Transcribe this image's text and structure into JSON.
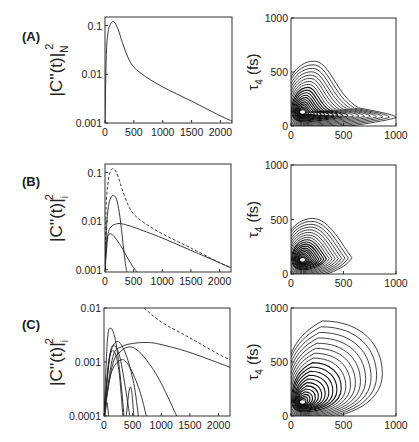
{
  "figure": {
    "panels": [
      {
        "label": "(A)",
        "left_ylabel_main": "|C''(t)|",
        "left_ylabel_sub": "N",
        "left_ylabel_sup": "2"
      },
      {
        "label": "(B)",
        "left_ylabel_main": "|C''(t)|",
        "left_ylabel_sub": "i",
        "left_ylabel_sup": "2"
      },
      {
        "label": "(C)",
        "left_ylabel_main": "|C''(t)|",
        "left_ylabel_sub": "i",
        "left_ylabel_sup": "2"
      }
    ],
    "right_ylabel": "τ",
    "right_ylabel_sub": "4",
    "right_ylabel_unit": "(fs)"
  },
  "chart_data": [
    {
      "id": "A-left",
      "type": "line",
      "yscale": "log",
      "xlabel": "",
      "ylabel": "|C''_N(t)|^2",
      "xlim": [
        0,
        2200
      ],
      "ylim": [
        0.001,
        0.15
      ],
      "xticks": [
        "0",
        "500",
        "1000",
        "1500",
        "2000"
      ],
      "yticks": [
        "0.001",
        "0.01",
        "0.1"
      ],
      "series": [
        {
          "name": "total",
          "style": "solid",
          "x": [
            0,
            20,
            50,
            100,
            150,
            200,
            250,
            300,
            400,
            500,
            700,
            1000,
            1500,
            2000,
            2200
          ],
          "y": [
            0.001,
            0.02,
            0.07,
            0.11,
            0.12,
            0.1,
            0.07,
            0.045,
            0.022,
            0.014,
            0.009,
            0.0055,
            0.0028,
            0.0014,
            0.0011
          ]
        }
      ]
    },
    {
      "id": "A-right",
      "type": "contour",
      "xlabel": "",
      "ylabel": "τ4 (fs)",
      "xlim": [
        0,
        1000
      ],
      "ylim": [
        0,
        1000
      ],
      "xticks": [
        "0",
        "500",
        "1000"
      ],
      "yticks": [
        "0",
        "500",
        "1000"
      ],
      "peak": [
        110,
        130
      ],
      "outer_contour_extent": {
        "x_max": 1000,
        "y_max": 600
      }
    },
    {
      "id": "B-left",
      "type": "line",
      "yscale": "log",
      "xlabel": "",
      "ylabel": "|C''_i(t)|^2",
      "xlim": [
        0,
        2200
      ],
      "ylim": [
        0.0009,
        0.15
      ],
      "xticks": [
        "0",
        "500",
        "1000",
        "1500",
        "2000"
      ],
      "yticks": [
        "0.001",
        "0.01",
        "0.1"
      ],
      "series": [
        {
          "name": "total",
          "style": "dashed",
          "x": [
            0,
            20,
            60,
            100,
            150,
            200,
            250,
            300,
            400,
            500,
            700,
            1000,
            1500,
            2000,
            2200
          ],
          "y": [
            0.001,
            0.02,
            0.07,
            0.11,
            0.12,
            0.1,
            0.07,
            0.045,
            0.022,
            0.014,
            0.009,
            0.0055,
            0.0028,
            0.0014,
            0.0011
          ]
        },
        {
          "name": "i=1",
          "style": "solid",
          "x": [
            0,
            30,
            60,
            100,
            150,
            200,
            250,
            300,
            350,
            380
          ],
          "y": [
            0.001,
            0.008,
            0.02,
            0.03,
            0.034,
            0.028,
            0.015,
            0.005,
            0.0015,
            0.0009
          ]
        },
        {
          "name": "i=2",
          "style": "solid",
          "x": [
            0,
            50,
            100,
            200,
            300,
            500,
            1000,
            1500,
            2000,
            2200
          ],
          "y": [
            0.001,
            0.005,
            0.0075,
            0.0088,
            0.0088,
            0.0075,
            0.0045,
            0.0025,
            0.0014,
            0.0011
          ]
        },
        {
          "name": "i=3",
          "style": "solid",
          "x": [
            0,
            30,
            60,
            100,
            150,
            200,
            300,
            400,
            500,
            560
          ],
          "y": [
            0.001,
            0.004,
            0.0052,
            0.0055,
            0.005,
            0.0042,
            0.0028,
            0.0017,
            0.0011,
            0.0009
          ]
        }
      ]
    },
    {
      "id": "B-right",
      "type": "contour",
      "xlabel": "",
      "ylabel": "τ4 (fs)",
      "xlim": [
        0,
        1000
      ],
      "ylim": [
        0,
        1000
      ],
      "xticks": [
        "0",
        "500",
        "1000"
      ],
      "yticks": [
        "0",
        "500",
        "1000"
      ],
      "peak": [
        110,
        130
      ],
      "outer_contour_extent": {
        "x_max": 580,
        "y_max": 510
      }
    },
    {
      "id": "C-left",
      "type": "line",
      "yscale": "log",
      "xlabel": "",
      "ylabel": "|C''_i(t)|^2",
      "xlim": [
        0,
        2200
      ],
      "ylim": [
        0.0001,
        0.01
      ],
      "xticks": [
        "0",
        "500",
        "1000",
        "1500",
        "2000"
      ],
      "yticks": [
        "0.0001",
        "0.001",
        "0.01"
      ],
      "series": [
        {
          "name": "total",
          "style": "dashed",
          "x": [
            700,
            1000,
            1500,
            2000,
            2200
          ],
          "y": [
            0.01,
            0.0055,
            0.0028,
            0.0014,
            0.0011
          ]
        },
        {
          "name": "mode-a",
          "style": "solid",
          "x": [
            0,
            150,
            300,
            500,
            750,
            1000,
            1500,
            2200
          ],
          "y": [
            0.0001,
            0.0012,
            0.0019,
            0.0022,
            0.0023,
            0.0021,
            0.0015,
            0.0008
          ]
        },
        {
          "name": "mode-b",
          "style": "solid",
          "x": [
            0,
            150,
            300,
            450,
            600,
            800,
            1000,
            1270
          ],
          "y": [
            0.0001,
            0.0009,
            0.0016,
            0.0019,
            0.0016,
            0.0009,
            0.0004,
            0.0001
          ]
        },
        {
          "name": "mode-c",
          "style": "solid",
          "x": [
            0,
            60,
            120,
            200,
            280,
            350
          ],
          "y": [
            0.0001,
            0.0025,
            0.0042,
            0.0025,
            0.0006,
            0.0001
          ]
        },
        {
          "name": "mode-d",
          "style": "solid",
          "x": [
            0,
            100,
            230,
            380,
            520,
            600
          ],
          "y": [
            0.0001,
            0.0012,
            0.0024,
            0.0014,
            0.0004,
            0.0001
          ]
        },
        {
          "name": "mode-e",
          "style": "solid",
          "x": [
            0,
            100,
            180,
            280,
            380,
            450
          ],
          "y": [
            0.0001,
            0.0013,
            0.002,
            0.0012,
            0.0003,
            0.0001
          ]
        },
        {
          "name": "mode-f",
          "style": "solid",
          "x": [
            0,
            120,
            300,
            450,
            620,
            740
          ],
          "y": [
            0.0001,
            0.0006,
            0.0011,
            0.0008,
            0.0003,
            0.0001
          ]
        },
        {
          "name": "mode-g",
          "style": "solid",
          "x": [
            0,
            80,
            170,
            260,
            330
          ],
          "y": [
            0.0001,
            0.001,
            0.0016,
            0.0007,
            0.0001
          ]
        },
        {
          "name": "mode-h",
          "style": "solid",
          "x": [
            390,
            440,
            480,
            520
          ],
          "y": [
            0.0001,
            0.0003,
            0.0003,
            0.0001
          ]
        },
        {
          "name": "mode-i",
          "style": "solid",
          "x": [
            20,
            50,
            80
          ],
          "y": [
            0.0001,
            0.00018,
            0.0001
          ]
        }
      ]
    },
    {
      "id": "C-right",
      "type": "contour",
      "xlabel": "",
      "ylabel": "τ4 (fs)",
      "xlim": [
        0,
        1000
      ],
      "ylim": [
        0,
        1000
      ],
      "xticks": [
        "0",
        "500",
        "1000"
      ],
      "yticks": [
        "0",
        "500",
        "1000"
      ],
      "peak": [
        110,
        130
      ],
      "outer_contour_extent": {
        "x_max": 870,
        "y_max": 880
      }
    }
  ]
}
